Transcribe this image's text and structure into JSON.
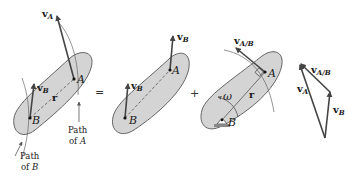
{
  "figure": {
    "panel1": {
      "label_vA": "v",
      "label_vA_sub": "A",
      "label_vB": "v",
      "label_vB_sub": "B",
      "label_r": "r",
      "point_A": "A",
      "point_B": "B",
      "path_A_line1": "Path",
      "path_A_line2": "of",
      "path_A_line2_italic": "A",
      "path_B_line1": "Path",
      "path_B_line2": "of",
      "path_B_line2_italic": "B"
    },
    "equals_sign": "=",
    "panel2": {
      "label_vB_top": "v",
      "label_vB_top_sub": "B",
      "label_vB": "v",
      "label_vB_sub": "B",
      "point_A": "A",
      "point_B": "B"
    },
    "plus_sign": "+",
    "panel3": {
      "label_vAB": "v",
      "label_vAB_sub": "A/B",
      "label_r": "r",
      "label_omega": "ω",
      "point_A": "A",
      "point_B": "B"
    },
    "triangle": {
      "label_vAB": "v",
      "label_vAB_sub": "A/B",
      "label_vA": "v",
      "label_vA_sub": "A",
      "label_vB": "v",
      "label_vB_sub": "B"
    }
  }
}
